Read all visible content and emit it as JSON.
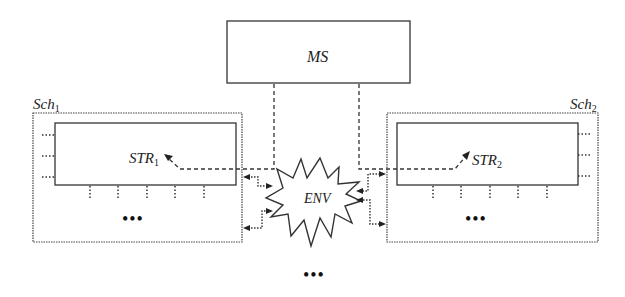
{
  "diagram": {
    "nodes": {
      "ms": {
        "label": "MS"
      },
      "sch1": {
        "label": "Sch",
        "subscript": "1"
      },
      "sch2": {
        "label": "Sch",
        "subscript": "2"
      },
      "str1": {
        "label": "STR",
        "subscript": "1"
      },
      "str2": {
        "label": "STR",
        "subscript": "2"
      },
      "env": {
        "label": "ENV"
      }
    },
    "ellipsis": {
      "sch1": "•••",
      "sch2": "•••",
      "bottom": "•••"
    },
    "edges": [
      {
        "from": "ms",
        "to": "str1",
        "style": "dashed"
      },
      {
        "from": "ms",
        "to": "str2",
        "style": "dashed"
      },
      {
        "from": "env",
        "to": "sch1",
        "style": "dotted",
        "count": 2
      },
      {
        "from": "sch1",
        "to": "env",
        "style": "dotted",
        "count": 2
      },
      {
        "from": "env",
        "to": "sch2",
        "style": "dotted",
        "count": 2
      },
      {
        "from": "sch2",
        "to": "env",
        "style": "dotted",
        "count": 2
      }
    ],
    "colors": {
      "stroke": "#333333",
      "background": "#ffffff"
    }
  }
}
